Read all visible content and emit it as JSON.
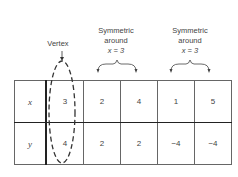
{
  "annotations": {
    "vertex": "Vertex",
    "sym1": {
      "line1": "Symmetric",
      "line2": "around",
      "line3": "x = 3"
    },
    "sym2": {
      "line1": "Symmetric",
      "line2": "around",
      "line3": "x = 3"
    }
  },
  "table": {
    "rows": [
      {
        "header": "x",
        "values": [
          "3",
          "2",
          "4",
          "1",
          "5"
        ]
      },
      {
        "header": "y",
        "values": [
          "4",
          "2",
          "2",
          "−4",
          "−4"
        ]
      }
    ]
  }
}
